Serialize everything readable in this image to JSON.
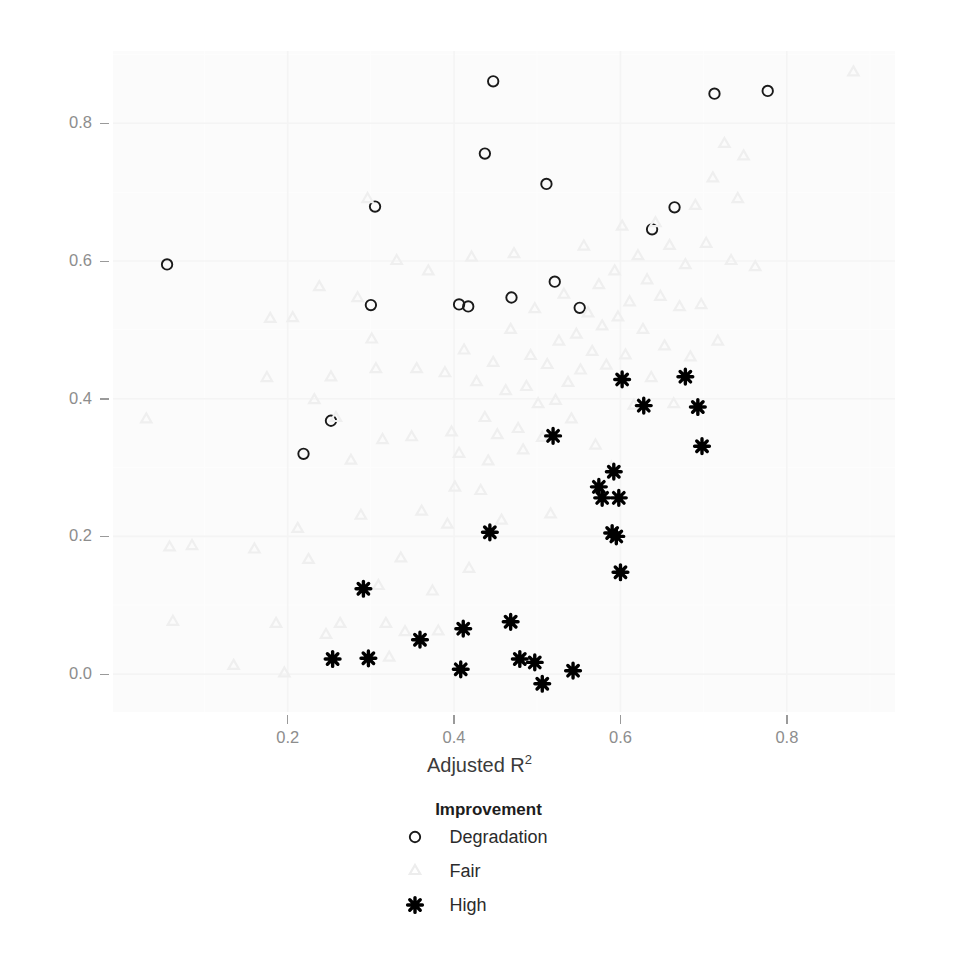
{
  "chart_data": {
    "type": "scatter",
    "title": "",
    "xlabel": "Adjusted R2",
    "xlabel_base": "Adjusted R",
    "xlabel_sup": "2",
    "ylabel": "PVE of OK",
    "xlim": [
      -0.01,
      0.93
    ],
    "ylim": [
      -0.055,
      0.905
    ],
    "xticks": [
      0.2,
      0.4,
      0.6,
      0.8
    ],
    "xtick_labels": [
      "0.2",
      "0.4",
      "0.6",
      "0.8"
    ],
    "yticks": [
      0.0,
      0.2,
      0.4,
      0.6,
      0.8
    ],
    "ytick_labels": [
      "0.0",
      "0.2",
      "0.4",
      "0.6",
      "0.8"
    ],
    "grid": true,
    "grid_major_color": "#ffffff",
    "panel_background": "#fbfbfb",
    "legend_position": "bottom",
    "legend_title": "Improvement",
    "series": [
      {
        "name": "Degradation",
        "marker": "open-circle",
        "color": "#1a1a1a",
        "points": [
          [
            0.055,
            0.595
          ],
          [
            0.219,
            0.32
          ],
          [
            0.252,
            0.368
          ],
          [
            0.3,
            0.536
          ],
          [
            0.305,
            0.679
          ],
          [
            0.406,
            0.537
          ],
          [
            0.417,
            0.534
          ],
          [
            0.437,
            0.756
          ],
          [
            0.447,
            0.861
          ],
          [
            0.469,
            0.547
          ],
          [
            0.511,
            0.712
          ],
          [
            0.521,
            0.57
          ],
          [
            0.551,
            0.532
          ],
          [
            0.638,
            0.646
          ],
          [
            0.665,
            0.678
          ],
          [
            0.713,
            0.843
          ],
          [
            0.777,
            0.847
          ]
        ]
      },
      {
        "name": "Fair",
        "marker": "light-triangle",
        "color": "#efefef",
        "points": [
          [
            0.03,
            0.37
          ],
          [
            0.058,
            0.184
          ],
          [
            0.062,
            0.076
          ],
          [
            0.085,
            0.186
          ],
          [
            0.135,
            0.012
          ],
          [
            0.16,
            0.181
          ],
          [
            0.175,
            0.43
          ],
          [
            0.179,
            0.516
          ],
          [
            0.186,
            0.073
          ],
          [
            0.196,
            0.001
          ],
          [
            0.206,
            0.517
          ],
          [
            0.212,
            0.211
          ],
          [
            0.225,
            0.166
          ],
          [
            0.232,
            0.398
          ],
          [
            0.238,
            0.562
          ],
          [
            0.246,
            0.057
          ],
          [
            0.252,
            0.431
          ],
          [
            0.258,
            0.372
          ],
          [
            0.263,
            0.073
          ],
          [
            0.276,
            0.31
          ],
          [
            0.284,
            0.546
          ],
          [
            0.288,
            0.23
          ],
          [
            0.296,
            0.69
          ],
          [
            0.301,
            0.486
          ],
          [
            0.306,
            0.443
          ],
          [
            0.309,
            0.128
          ],
          [
            0.314,
            0.34
          ],
          [
            0.318,
            0.073
          ],
          [
            0.322,
            0.024
          ],
          [
            0.331,
            0.6
          ],
          [
            0.336,
            0.168
          ],
          [
            0.341,
            0.061
          ],
          [
            0.349,
            0.344
          ],
          [
            0.355,
            0.443
          ],
          [
            0.361,
            0.236
          ],
          [
            0.369,
            0.585
          ],
          [
            0.374,
            0.12
          ],
          [
            0.381,
            0.062
          ],
          [
            0.389,
            0.437
          ],
          [
            0.392,
            0.217
          ],
          [
            0.397,
            0.351
          ],
          [
            0.401,
            0.271
          ],
          [
            0.406,
            0.32
          ],
          [
            0.412,
            0.47
          ],
          [
            0.418,
            0.153
          ],
          [
            0.421,
            0.605
          ],
          [
            0.427,
            0.424
          ],
          [
            0.432,
            0.266
          ],
          [
            0.437,
            0.372
          ],
          [
            0.441,
            0.309
          ],
          [
            0.447,
            0.452
          ],
          [
            0.452,
            0.347
          ],
          [
            0.457,
            0.223
          ],
          [
            0.462,
            0.411
          ],
          [
            0.468,
            0.5
          ],
          [
            0.472,
            0.61
          ],
          [
            0.477,
            0.356
          ],
          [
            0.483,
            0.325
          ],
          [
            0.487,
            0.417
          ],
          [
            0.492,
            0.462
          ],
          [
            0.497,
            0.53
          ],
          [
            0.501,
            0.392
          ],
          [
            0.506,
            0.343
          ],
          [
            0.512,
            0.449
          ],
          [
            0.516,
            0.232
          ],
          [
            0.522,
            0.397
          ],
          [
            0.526,
            0.483
          ],
          [
            0.532,
            0.551
          ],
          [
            0.537,
            0.423
          ],
          [
            0.541,
            0.37
          ],
          [
            0.547,
            0.493
          ],
          [
            0.552,
            0.441
          ],
          [
            0.556,
            0.621
          ],
          [
            0.561,
            0.524
          ],
          [
            0.566,
            0.468
          ],
          [
            0.57,
            0.332
          ],
          [
            0.574,
            0.565
          ],
          [
            0.578,
            0.505
          ],
          [
            0.583,
            0.448
          ],
          [
            0.589,
            0.3
          ],
          [
            0.593,
            0.585
          ],
          [
            0.597,
            0.518
          ],
          [
            0.602,
            0.65
          ],
          [
            0.606,
            0.463
          ],
          [
            0.611,
            0.54
          ],
          [
            0.616,
            0.39
          ],
          [
            0.621,
            0.607
          ],
          [
            0.627,
            0.5
          ],
          [
            0.632,
            0.572
          ],
          [
            0.637,
            0.43
          ],
          [
            0.642,
            0.655
          ],
          [
            0.648,
            0.548
          ],
          [
            0.653,
            0.476
          ],
          [
            0.659,
            0.622
          ],
          [
            0.664,
            0.392
          ],
          [
            0.671,
            0.533
          ],
          [
            0.678,
            0.594
          ],
          [
            0.684,
            0.46
          ],
          [
            0.69,
            0.68
          ],
          [
            0.697,
            0.536
          ],
          [
            0.703,
            0.625
          ],
          [
            0.711,
            0.72
          ],
          [
            0.717,
            0.483
          ],
          [
            0.725,
            0.77
          ],
          [
            0.733,
            0.6
          ],
          [
            0.741,
            0.69
          ],
          [
            0.748,
            0.752
          ],
          [
            0.762,
            0.591
          ],
          [
            0.88,
            0.874
          ]
        ]
      },
      {
        "name": "High",
        "marker": "asterisk",
        "color": "#000000",
        "points": [
          [
            0.254,
            0.022
          ],
          [
            0.291,
            0.124
          ],
          [
            0.297,
            0.023
          ],
          [
            0.359,
            0.05
          ],
          [
            0.408,
            0.007
          ],
          [
            0.411,
            0.066
          ],
          [
            0.443,
            0.206
          ],
          [
            0.468,
            0.076
          ],
          [
            0.479,
            0.022
          ],
          [
            0.497,
            0.017
          ],
          [
            0.506,
            -0.014
          ],
          [
            0.519,
            0.346
          ],
          [
            0.543,
            0.005
          ],
          [
            0.574,
            0.272
          ],
          [
            0.578,
            0.256
          ],
          [
            0.59,
            0.205
          ],
          [
            0.592,
            0.294
          ],
          [
            0.595,
            0.2
          ],
          [
            0.598,
            0.256
          ],
          [
            0.6,
            0.148
          ],
          [
            0.602,
            0.428
          ],
          [
            0.628,
            0.39
          ],
          [
            0.678,
            0.432
          ],
          [
            0.693,
            0.388
          ],
          [
            0.698,
            0.331
          ]
        ]
      }
    ]
  },
  "legend": {
    "title": "Improvement",
    "items": [
      {
        "label": "Degradation",
        "marker": "open-circle"
      },
      {
        "label": "Fair",
        "marker": "light-triangle"
      },
      {
        "label": "High",
        "marker": "asterisk"
      }
    ]
  }
}
